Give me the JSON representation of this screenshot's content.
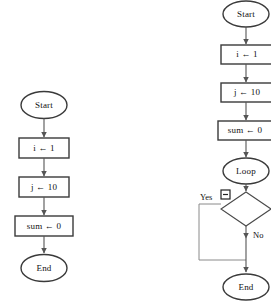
{
  "document": {
    "title": "Flowchart Diagram",
    "background_color": "#ffffff",
    "width": 271,
    "height": 305
  },
  "colors": {
    "shape_stroke": "#3a3a3a",
    "connector_stroke": "#555555",
    "connector_light": "#8a8a8a",
    "text": "#111111",
    "shape_fill": "#ffffff"
  },
  "flowchart_left": {
    "name": "simple-sequence-flowchart",
    "nodes": [
      {
        "id": "start",
        "shape": "ellipse",
        "label": "Start"
      },
      {
        "id": "init_i",
        "shape": "rectangle",
        "label": "i ← 1"
      },
      {
        "id": "init_j",
        "shape": "rectangle",
        "label": "j ← 10"
      },
      {
        "id": "init_s",
        "shape": "rectangle",
        "label": "sum ← 0"
      },
      {
        "id": "end",
        "shape": "ellipse",
        "label": "End"
      }
    ],
    "edges": [
      {
        "from": "start",
        "to": "init_i",
        "label": ""
      },
      {
        "from": "init_i",
        "to": "init_j",
        "label": ""
      },
      {
        "from": "init_j",
        "to": "init_s",
        "label": ""
      },
      {
        "from": "init_s",
        "to": "end",
        "label": ""
      }
    ]
  },
  "flowchart_right": {
    "name": "loop-decision-flowchart",
    "clipped_right_edge": true,
    "nodes": [
      {
        "id": "start",
        "shape": "ellipse",
        "label": "Start"
      },
      {
        "id": "init_i",
        "shape": "rectangle",
        "label": "i ← 1"
      },
      {
        "id": "init_j",
        "shape": "rectangle",
        "label": "j ← 10"
      },
      {
        "id": "init_s",
        "shape": "rectangle",
        "label": "sum ← 0"
      },
      {
        "id": "loop",
        "shape": "ellipse",
        "label": "Loop"
      },
      {
        "id": "decision",
        "shape": "diamond",
        "label": ""
      },
      {
        "id": "end",
        "shape": "ellipse",
        "label": "End"
      }
    ],
    "edges": [
      {
        "from": "start",
        "to": "init_i",
        "label": ""
      },
      {
        "from": "init_i",
        "to": "init_j",
        "label": ""
      },
      {
        "from": "init_j",
        "to": "init_s",
        "label": ""
      },
      {
        "from": "init_s",
        "to": "loop",
        "label": ""
      },
      {
        "from": "loop",
        "to": "decision",
        "label": ""
      },
      {
        "from": "decision",
        "to": "end",
        "label": "Yes"
      },
      {
        "from": "decision",
        "to": "end",
        "label": "No"
      }
    ],
    "branch_labels": {
      "yes": "Yes",
      "no": "No"
    },
    "collapse_icon": {
      "name": "collapse-minus-box-icon",
      "glyph": "⊟"
    }
  }
}
